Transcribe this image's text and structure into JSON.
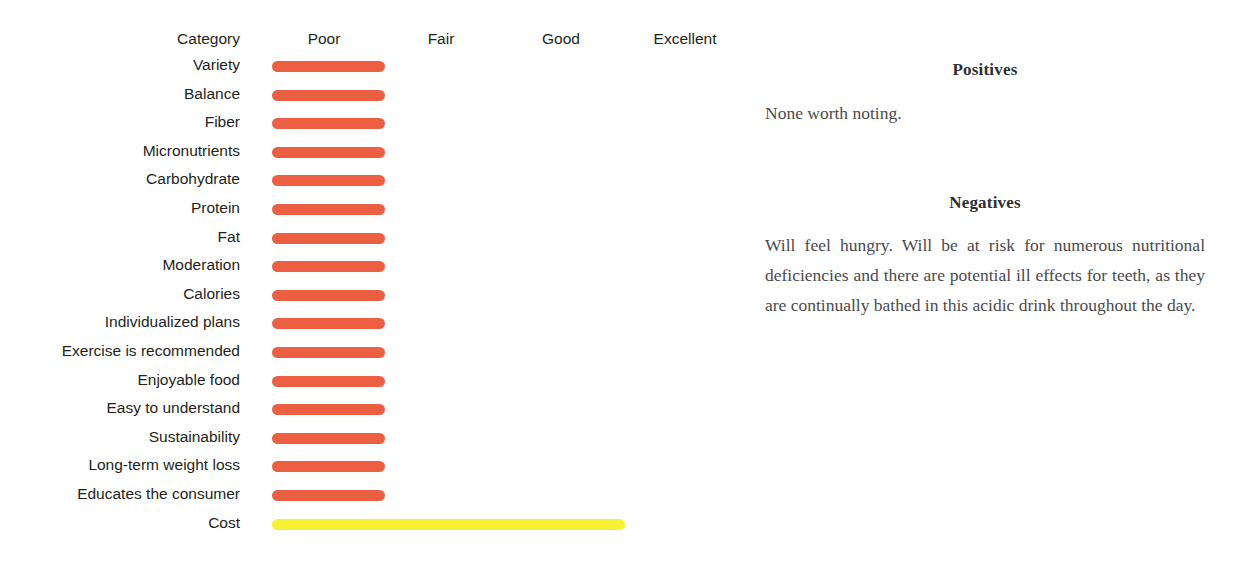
{
  "chart_data": {
    "type": "bar",
    "title": "",
    "xlabel": "",
    "ylabel": "Category",
    "orientation": "horizontal",
    "grid": false,
    "legend": false,
    "scale_labels": [
      "Poor",
      "Fair",
      "Good",
      "Excellent"
    ],
    "scale_values": [
      1,
      2,
      3,
      4
    ],
    "category_header": "Category",
    "categories": [
      "Variety",
      "Balance",
      "Fiber",
      "Micronutrients",
      "Carbohydrate",
      "Protein",
      "Fat",
      "Moderation",
      "Calories",
      "Individualized plans",
      "Exercise is recommended",
      "Enjoyable food",
      "Easy to understand",
      "Sustainability",
      "Long-term weight loss",
      "Educates the consumer",
      "Cost"
    ],
    "values": [
      1,
      1,
      1,
      1,
      1,
      1,
      1,
      1,
      1,
      1,
      1,
      1,
      1,
      1,
      1,
      1,
      4
    ],
    "ratings": [
      "Poor",
      "Poor",
      "Poor",
      "Poor",
      "Poor",
      "Poor",
      "Poor",
      "Poor",
      "Poor",
      "Poor",
      "Poor",
      "Poor",
      "Poor",
      "Poor",
      "Poor",
      "Poor",
      "Excellent"
    ],
    "bar_colors": [
      "#ed5f43",
      "#ed5f43",
      "#ed5f43",
      "#ed5f43",
      "#ed5f43",
      "#ed5f43",
      "#ed5f43",
      "#ed5f43",
      "#ed5f43",
      "#ed5f43",
      "#ed5f43",
      "#ed5f43",
      "#ed5f43",
      "#ed5f43",
      "#ed5f43",
      "#ed5f43",
      "#f7f034"
    ],
    "bar_widths_px": [
      113,
      113,
      113,
      113,
      113,
      113,
      113,
      113,
      113,
      113,
      113,
      113,
      113,
      113,
      113,
      113,
      353
    ]
  },
  "colors": {
    "poor": "#ed5f43",
    "excellent": "#f7f034",
    "label_text": "#231f20",
    "notes_text": "#4a4a4c",
    "background": "#ffffff"
  },
  "notes": {
    "positives": {
      "heading": "Positives",
      "body": "None worth noting."
    },
    "negatives": {
      "heading": "Negatives",
      "body": "Will feel hungry. Will be at risk for numerous nutritional deficiencies and there are potential ill effects for teeth, as they are continually bathed in this acidic drink throughout the day."
    }
  }
}
